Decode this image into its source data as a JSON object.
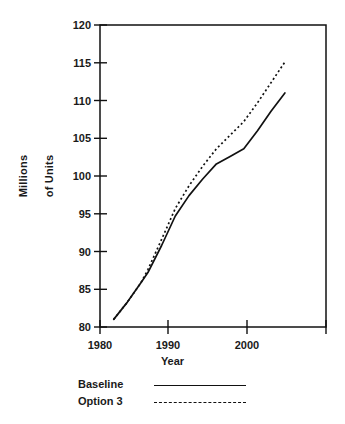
{
  "chart_data": {
    "type": "line",
    "title": "",
    "xlabel": "Year",
    "ylabel": "Millions\nof Units",
    "xlim": [
      1979,
      2012
    ],
    "ylim": [
      80,
      120
    ],
    "xticks": [
      1980,
      1990,
      2000
    ],
    "yticks": [
      80,
      85,
      90,
      95,
      100,
      105,
      110,
      115,
      120
    ],
    "grid": false,
    "legend_position": "below-plot",
    "frame": "box",
    "series": [
      {
        "name": "Baseline",
        "style": "solid",
        "color": "#111111",
        "x": [
          1981,
          1983,
          1985,
          1986,
          1988,
          1990,
          1992,
          1994,
          1996,
          1998,
          2000,
          2002,
          2004,
          2006
        ],
        "values": [
          81.0,
          83.3,
          85.9,
          87.2,
          90.8,
          94.7,
          97.4,
          99.6,
          101.6,
          102.6,
          103.6,
          106.0,
          108.6,
          111.0
        ]
      },
      {
        "name": "Option 3",
        "style": "dotted",
        "color": "#111111",
        "x": [
          1981,
          1983,
          1985,
          1986,
          1988,
          1990,
          1992,
          1994,
          1996,
          1998,
          2000,
          2002,
          2004,
          2006
        ],
        "values": [
          81.0,
          83.3,
          85.9,
          87.6,
          91.6,
          95.7,
          98.7,
          101.3,
          103.6,
          105.4,
          107.2,
          109.7,
          112.4,
          115.1
        ]
      }
    ]
  },
  "axes": {
    "y_tick_labels": [
      "120",
      "115",
      "110",
      "105",
      "100",
      "95",
      "90",
      "85",
      "80"
    ],
    "x_tick_labels": [
      "1980",
      "1990",
      "2000"
    ],
    "y_axis_title_line1": "Millions",
    "y_axis_title_line2": "of Units",
    "x_axis_title": "Year"
  },
  "legend": {
    "items": [
      {
        "label": "Baseline",
        "style": "solid"
      },
      {
        "label": "Option 3",
        "style": "dotted"
      }
    ]
  }
}
